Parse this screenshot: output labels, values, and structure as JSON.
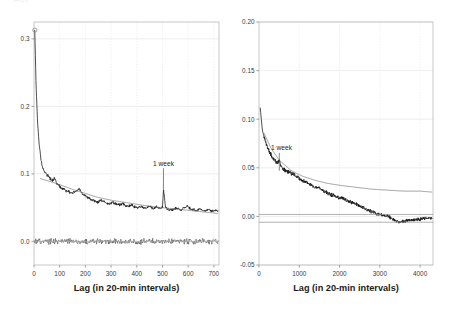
{
  "figure": {
    "clipped_header_text": "ACF",
    "background_color": "#ffffff",
    "grid_color": "#e8e8e8",
    "frame_color": "#b9b9b9",
    "series_color": "#111111",
    "trend_color": "#777777",
    "panel_count": 2
  },
  "chart_data": [
    {
      "panel": "left",
      "type": "line",
      "title": "",
      "xlabel": "Lag (in 20-min intervals)",
      "ylabel": "",
      "xlim": [
        0,
        720
      ],
      "ylim": [
        -0.035,
        0.325
      ],
      "xticks": [
        0,
        100,
        200,
        300,
        400,
        500,
        600,
        700
      ],
      "xticklabels": [
        "0",
        "100",
        "200",
        "300",
        "400",
        "500",
        "600",
        "700"
      ],
      "yticks": [
        0.0,
        0.1,
        0.2,
        0.3
      ],
      "yticklabels": [
        "0.0",
        "0.1",
        "0.2",
        "0.3"
      ],
      "grid": true,
      "legend": "none",
      "annotations": [
        {
          "text": "1 week",
          "x": 504,
          "y": 0.112,
          "points_to_x": 504,
          "points_to_y": 0.072
        }
      ],
      "series": [
        {
          "name": "autocorrelation",
          "style": "noisy-line",
          "marker_at_origin": {
            "x": 3,
            "y": 0.313,
            "shape": "circle"
          },
          "x": [
            3,
            8,
            14,
            20,
            26,
            32,
            40,
            48,
            56,
            64,
            72,
            80,
            88,
            96,
            104,
            116,
            128,
            140,
            152,
            164,
            176,
            188,
            200,
            212,
            224,
            236,
            248,
            260,
            272,
            284,
            296,
            308,
            320,
            332,
            344,
            356,
            368,
            380,
            392,
            404,
            416,
            428,
            440,
            452,
            464,
            476,
            488,
            500,
            504,
            512,
            524,
            536,
            548,
            560,
            572,
            584,
            596,
            608,
            620,
            632,
            644,
            656,
            668,
            680,
            692,
            704,
            716
          ],
          "y": [
            0.313,
            0.232,
            0.176,
            0.144,
            0.124,
            0.112,
            0.104,
            0.1,
            0.097,
            0.093,
            0.09,
            0.095,
            0.086,
            0.083,
            0.08,
            0.077,
            0.075,
            0.073,
            0.072,
            0.074,
            0.078,
            0.071,
            0.067,
            0.064,
            0.062,
            0.06,
            0.058,
            0.061,
            0.059,
            0.057,
            0.056,
            0.058,
            0.055,
            0.054,
            0.056,
            0.053,
            0.052,
            0.054,
            0.051,
            0.05,
            0.052,
            0.049,
            0.05,
            0.052,
            0.048,
            0.051,
            0.049,
            0.05,
            0.078,
            0.05,
            0.047,
            0.046,
            0.049,
            0.048,
            0.046,
            0.05,
            0.052,
            0.049,
            0.047,
            0.046,
            0.048,
            0.046,
            0.045,
            0.047,
            0.045,
            0.046,
            0.045
          ]
        },
        {
          "name": "fitted-trend",
          "style": "smooth-thin",
          "x": [
            24,
            60,
            100,
            150,
            200,
            250,
            300,
            350,
            400,
            450,
            500,
            550,
            600,
            650,
            700,
            716
          ],
          "y": [
            0.093,
            0.089,
            0.084,
            0.077,
            0.071,
            0.065,
            0.061,
            0.058,
            0.055,
            0.052,
            0.05,
            0.048,
            0.046,
            0.044,
            0.042,
            0.041
          ]
        },
        {
          "name": "residuals",
          "style": "noisy-line-flat",
          "baseline": 0.0,
          "amplitude": 0.006,
          "x_start": 0,
          "x_end": 716
        }
      ]
    },
    {
      "panel": "right",
      "type": "line",
      "title": "",
      "xlabel": "Lag (in 20-min intervals)",
      "ylabel": "",
      "xlim": [
        0,
        4320
      ],
      "ylim": [
        -0.05,
        0.2
      ],
      "xticks": [
        0,
        1000,
        2000,
        3000,
        4000
      ],
      "xticklabels": [
        "0",
        "1000",
        "2000",
        "3000",
        "4000"
      ],
      "yticks": [
        -0.05,
        0.0,
        0.05,
        0.1,
        0.15,
        0.2
      ],
      "yticklabels": [
        "-0.05",
        "0.00",
        "0.05",
        "0.10",
        "0.15",
        "0.20"
      ],
      "grid": true,
      "legend": "none",
      "annotations": [
        {
          "text": "1 week",
          "x": 560,
          "y": 0.068,
          "points_to_x": 504,
          "points_to_y": 0.047
        }
      ],
      "series": [
        {
          "name": "autocorrelation",
          "style": "noisy-line",
          "x": [
            30,
            80,
            140,
            200,
            260,
            320,
            380,
            440,
            504,
            560,
            620,
            700,
            780,
            860,
            950,
            1040,
            1130,
            1220,
            1310,
            1400,
            1500,
            1600,
            1700,
            1800,
            1900,
            2000,
            2100,
            2200,
            2300,
            2400,
            2500,
            2600,
            2700,
            2800,
            2900,
            3000,
            3100,
            3200,
            3300,
            3400,
            3500,
            3600,
            3700,
            3800,
            3900,
            4000,
            4100,
            4200,
            4300
          ],
          "y": [
            0.112,
            0.09,
            0.079,
            0.072,
            0.066,
            0.062,
            0.058,
            0.055,
            0.058,
            0.05,
            0.048,
            0.046,
            0.045,
            0.043,
            0.041,
            0.038,
            0.036,
            0.034,
            0.032,
            0.03,
            0.029,
            0.026,
            0.024,
            0.022,
            0.021,
            0.019,
            0.018,
            0.016,
            0.014,
            0.013,
            0.011,
            0.009,
            0.007,
            0.005,
            0.003,
            0.002,
            0.001,
            0.0,
            -0.002,
            -0.005,
            -0.006,
            -0.005,
            -0.004,
            -0.004,
            -0.003,
            -0.003,
            -0.002,
            -0.002,
            -0.002
          ]
        },
        {
          "name": "fitted-trend",
          "style": "smooth-thin",
          "x": [
            120,
            300,
            500,
            800,
            1100,
            1400,
            1700,
            2000,
            2400,
            2800,
            3200,
            3600,
            4000,
            4300
          ],
          "y": [
            0.086,
            0.07,
            0.058,
            0.047,
            0.041,
            0.037,
            0.034,
            0.032,
            0.03,
            0.028,
            0.027,
            0.026,
            0.026,
            0.025
          ]
        },
        {
          "name": "zero-reference",
          "style": "flat-line",
          "y": 0.002
        },
        {
          "name": "lower-reference",
          "style": "flat-line",
          "y": -0.006
        }
      ]
    }
  ]
}
